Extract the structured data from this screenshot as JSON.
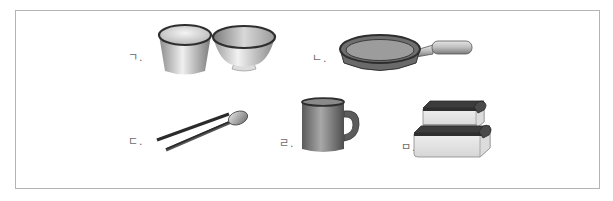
{
  "figure": {
    "items": [
      {
        "marker": "ㄱ.",
        "name": "cup and bowl"
      },
      {
        "marker": "ㄴ.",
        "name": "frying pan"
      },
      {
        "marker": "ㄷ.",
        "name": "chopsticks and spoon"
      },
      {
        "marker": "ㄹ.",
        "name": "mug"
      },
      {
        "marker": "ㅁ.",
        "name": "stacked food containers"
      }
    ]
  },
  "colors": {
    "frame_border": "#b4b4b4",
    "label_text": "#6a6a6a",
    "dark_rim": "#333333",
    "metal_light": "#e8e8e8",
    "metal_mid": "#a8a8a8",
    "pan_body": "#6e6e6e",
    "pan_inner": "#9a9a9a"
  }
}
